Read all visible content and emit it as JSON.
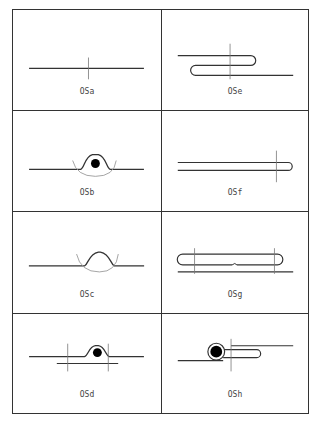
{
  "title": {
    "text": "",
    "note": "clipped"
  },
  "cells": [
    {
      "id": "OSa",
      "label": "OSa",
      "description": "straight line with vertical tick"
    },
    {
      "id": "OSe",
      "label": "OSe",
      "description": "line with S-shaped overlap loop and vertical tick"
    },
    {
      "id": "OSb",
      "label": "OSb",
      "description": "line with bump over black dot and grey arc"
    },
    {
      "id": "OSf",
      "label": "OSf",
      "description": "long doubled line with rounded end and vertical tick"
    },
    {
      "id": "OSc",
      "label": "OSc",
      "description": "line with empty bump and grey arc"
    },
    {
      "id": "OSg",
      "label": "OSg",
      "description": "two opposing hairpin loops over base line with two ticks"
    },
    {
      "id": "OSd",
      "label": "OSd",
      "description": "line with bump over black dot, lower offset line and two ticks"
    },
    {
      "id": "OSh",
      "label": "OSh",
      "description": "ringed black dot with hairpin loop and vertical tick"
    }
  ],
  "colors": {
    "stroke": "#333333",
    "grey": "#9a9a9a",
    "dot": "#000000",
    "border": "#333333"
  }
}
